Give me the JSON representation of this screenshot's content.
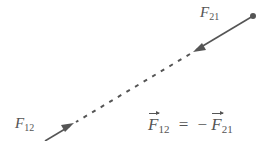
{
  "diagram": {
    "labels": {
      "force_21": {
        "symbol": "F",
        "subscript": "21"
      },
      "force_12": {
        "symbol": "F",
        "subscript": "12"
      }
    },
    "equation": {
      "lhs_symbol": "F",
      "lhs_subscript": "12",
      "equals": "=",
      "minus": "−",
      "rhs_symbol": "F",
      "rhs_subscript": "21"
    },
    "colors": {
      "line": "#555555",
      "text": "#555555"
    }
  }
}
